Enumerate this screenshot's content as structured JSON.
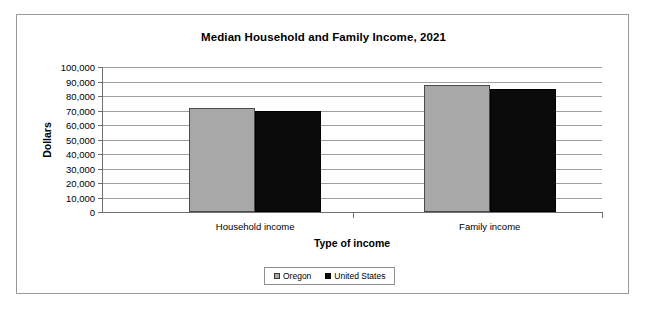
{
  "chart_data": {
    "type": "bar",
    "title": "Median Household and Family Income, 2021",
    "xlabel": "Type of income",
    "ylabel": "Dollars",
    "categories": [
      "Household income",
      "Family income"
    ],
    "series": [
      {
        "name": "Oregon",
        "color": "#a8a8a8",
        "values": [
          71700,
          87600
        ]
      },
      {
        "name": "United States",
        "color": "#0b0b0b",
        "values": [
          69700,
          84800
        ]
      }
    ],
    "ylim": [
      0,
      100000
    ],
    "ytick_values": [
      0,
      10000,
      20000,
      30000,
      40000,
      50000,
      60000,
      70000,
      80000,
      90000,
      100000
    ],
    "ytick_labels": [
      "0",
      "10,000",
      "20,000",
      "30,000",
      "40,000",
      "50,000",
      "60,000",
      "70,000",
      "80,000",
      "90,000",
      "100,000"
    ],
    "grid": true,
    "legend_position": "bottom"
  },
  "legend": {
    "entries": [
      {
        "label": "Oregon"
      },
      {
        "label": "United States"
      }
    ]
  }
}
